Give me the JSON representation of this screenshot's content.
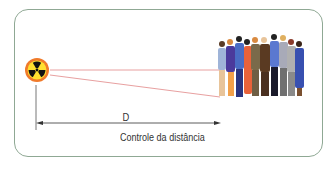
{
  "diagram": {
    "source_icon": "radiation-trefoil-icon",
    "target": "group-of-people",
    "distance_label": "D",
    "caption": "Controle da distância",
    "colors": {
      "frame_border": "#8fa894",
      "sight_lines": "#e8a0a0",
      "radiation_outer": "#f07a2a",
      "radiation_inner": "#ffe030",
      "radiation_trefoil": "#111111",
      "arrow": "#333333"
    }
  }
}
